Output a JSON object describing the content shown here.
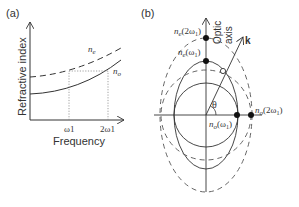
{
  "panel_a": {
    "label": "(a)",
    "ylabel": "Refractive index",
    "xlabel": "Frequency",
    "xticks": [
      "ω1",
      "2ω1"
    ],
    "curves": [
      {
        "name": "n_e",
        "label_main": "n",
        "label_sub": "e",
        "style": "dashed"
      },
      {
        "name": "n_o",
        "label_main": "n",
        "label_sub": "o",
        "style": "solid"
      }
    ]
  },
  "panel_b": {
    "label": "(b)",
    "optic_axis_label_1": "Optic",
    "optic_axis_label_2": "axis",
    "k_label": "k",
    "theta_label": "θ",
    "markers": {
      "ne_2w": {
        "main": "n",
        "sub": "e",
        "arg": "(2ω",
        "arg_sub": "1",
        "close": ")"
      },
      "ne_w": {
        "main": "n",
        "sub": "e",
        "arg": "(ω",
        "arg_sub": "1",
        "close": ")"
      },
      "no_w": {
        "main": "n",
        "sub": "o",
        "arg": "(ω",
        "arg_sub": "1",
        "close": ")"
      },
      "no_2w": {
        "main": "n",
        "sub": "o",
        "arg": "(2ω",
        "arg_sub": "1",
        "close": ")"
      }
    }
  },
  "colors": {
    "line": "#333333",
    "dotted": "#888888",
    "background": "#ffffff"
  }
}
